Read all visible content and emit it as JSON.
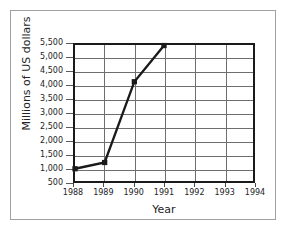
{
  "chart_data": {
    "type": "line",
    "title": "",
    "xlabel": "Year",
    "ylabel": "Millions of US dollars",
    "x": [
      1988,
      1989,
      1990,
      1991
    ],
    "values": [
      950,
      1180,
      4150,
      5480
    ],
    "series": [
      {
        "name": "Millions of US dollars",
        "values": [
          950,
          1180,
          4150,
          5480
        ]
      }
    ],
    "xlim": [
      1988,
      1994
    ],
    "ylim": [
      500,
      5500
    ],
    "xticks": [
      1988,
      1989,
      1990,
      1991,
      1992,
      1993,
      1994
    ],
    "xtick_labels": [
      "1988",
      "1989",
      "1990",
      "1991",
      "1992",
      "1993",
      "1994"
    ],
    "yticks": [
      500,
      1000,
      1500,
      2000,
      2500,
      3000,
      3500,
      4000,
      4500,
      5000,
      5500
    ],
    "ytick_labels": [
      "500",
      "1,000",
      "1,500",
      "2,000",
      "2,500",
      "3,000",
      "3,500",
      "4,000",
      "4,500",
      "5,000",
      "5,500"
    ],
    "grid": true,
    "legend": false,
    "legend_position": "none",
    "marker": "square",
    "line_color": "#1a1a1a",
    "marker_color": "#1a1a1a",
    "grid_color": "#6e6e6e",
    "frame_color": "#1a1a1a",
    "background_color": "#ffffff",
    "text_color": "#232323"
  },
  "axes": {
    "y_title": "Millions of US dollars",
    "x_title": "Year"
  }
}
